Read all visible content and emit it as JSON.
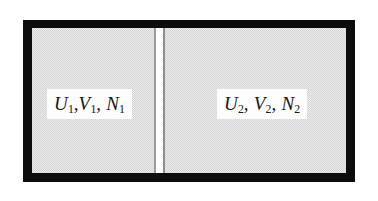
{
  "figure": {
    "type": "thermodynamic-partitioned-container",
    "colors": {
      "wall": "#0d0d0d",
      "gas_fill": "#d4d4d4",
      "partition": "#ffffff",
      "label_background": "#fdfdfd",
      "text": "#171717",
      "page_background": "#ffffff"
    }
  },
  "chambers": [
    {
      "id": "left",
      "name": "chamber-1",
      "label_parts": {
        "internal_energy": "U",
        "internal_energy_sub": "1",
        "volume": "V",
        "volume_sub": "1",
        "particle_number": "N",
        "particle_number_sub": "1"
      },
      "label_text": "U1,V1, N1"
    },
    {
      "id": "right",
      "name": "chamber-2",
      "label_parts": {
        "internal_energy": "U",
        "internal_energy_sub": "2",
        "volume": "V",
        "volume_sub": "2",
        "particle_number": "N",
        "particle_number_sub": "2"
      },
      "label_text": "U2, V2, N2"
    }
  ],
  "partition": {
    "name": "dividing-wall",
    "orientation": "vertical"
  },
  "punctuation": {
    "comma": ","
  }
}
